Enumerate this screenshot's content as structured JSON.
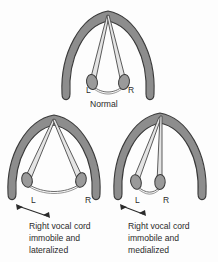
{
  "figure": {
    "title_semantic": "vocal-cord-position-diagram",
    "background_color": "#fdfdfd",
    "ink_color": "#2b2b2b",
    "cartilage_fill": "#8d8d8d",
    "cartilage_stroke": "#3a3a3a",
    "cord_fill": "#e4e4e4",
    "cord_stroke": "#4a4a4a",
    "arytenoid_fill": "#9a9a9a",
    "commissure_stroke": "#5a5a5a"
  },
  "panels": [
    {
      "id": "normal",
      "caption": "Normal",
      "left_label": "L",
      "right_label": "R",
      "arrow": null
    },
    {
      "id": "lateralized",
      "caption_lines": [
        "Right vocal cord",
        "immobile and",
        "lateralized"
      ],
      "left_label": "L",
      "right_label": "R",
      "arrow": "double-headed-arrow-lateral"
    },
    {
      "id": "medialized",
      "caption_lines": [
        "Right vocal cord",
        "immobile and",
        "medialized"
      ],
      "left_label": "L",
      "right_label": "R",
      "arrow": "double-headed-arrow-medial"
    }
  ],
  "labels": {
    "normal_caption": "Normal",
    "normal_L": "L",
    "normal_R": "R",
    "lat_L": "L",
    "lat_R": "R",
    "med_L": "L",
    "med_R": "R",
    "lat_line1": "Right vocal cord",
    "lat_line2": "immobile and",
    "lat_line3": "lateralized",
    "med_line1": "Right vocal cord",
    "med_line2": "immobile and",
    "med_line3": "medialized"
  }
}
